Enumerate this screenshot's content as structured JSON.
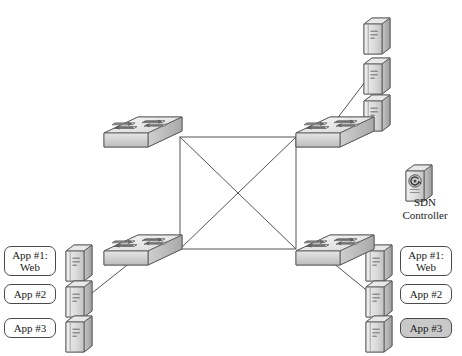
{
  "diagram": {
    "background_color": "#ffffff",
    "line_color": "#555555",
    "icon_fill_light": "#f2f2f2",
    "icon_fill_mid": "#d8d8d8",
    "icon_fill_dark": "#b8b8b8",
    "icon_stroke": "#5a5a5a"
  },
  "mesh": {
    "name": "full-mesh-core",
    "corners": {
      "x1": 180,
      "y1": 137,
      "x2": 296,
      "y2": 249
    },
    "diagonals": true
  },
  "switches": [
    {
      "id": "switch-top-left",
      "label": "",
      "x": 104,
      "y": 117
    },
    {
      "id": "switch-top-right",
      "label": "",
      "x": 296,
      "y": 117
    },
    {
      "id": "switch-bottom-left",
      "label": "",
      "x": 104,
      "y": 235
    },
    {
      "id": "switch-bottom-right",
      "label": "",
      "x": 296,
      "y": 235
    }
  ],
  "server_groups": [
    {
      "id": "servers-top-right",
      "servers": [
        {
          "id": "server-tr-1",
          "x": 364,
          "y": 18
        },
        {
          "id": "server-tr-2",
          "x": 364,
          "y": 58
        },
        {
          "id": "server-tr-3",
          "x": 364,
          "y": 95
        }
      ]
    },
    {
      "id": "servers-bottom-left",
      "servers": [
        {
          "id": "server-bl-1",
          "x": 66,
          "y": 245
        },
        {
          "id": "server-bl-2",
          "x": 66,
          "y": 281
        },
        {
          "id": "server-bl-3",
          "x": 66,
          "y": 316
        }
      ]
    },
    {
      "id": "servers-bottom-right",
      "servers": [
        {
          "id": "server-br-1",
          "x": 366,
          "y": 245
        },
        {
          "id": "server-br-2",
          "x": 366,
          "y": 281
        },
        {
          "id": "server-br-3",
          "x": 366,
          "y": 316
        }
      ]
    }
  ],
  "labels": {
    "left": [
      {
        "id": "label-left-app1",
        "text": "App #1:\nWeb",
        "x": 4,
        "y": 246,
        "w": 52,
        "h": 30,
        "shaded": false
      },
      {
        "id": "label-left-app2",
        "text": "App #2",
        "x": 4,
        "y": 284,
        "w": 52,
        "h": 20,
        "shaded": false
      },
      {
        "id": "label-left-app3",
        "text": "App #3",
        "x": 4,
        "y": 318,
        "w": 52,
        "h": 20,
        "shaded": false
      }
    ],
    "right": [
      {
        "id": "label-right-app1",
        "text": "App #1:\nWeb",
        "x": 400,
        "y": 246,
        "w": 52,
        "h": 30,
        "shaded": false
      },
      {
        "id": "label-right-app2",
        "text": "App #2",
        "x": 400,
        "y": 284,
        "w": 52,
        "h": 20,
        "shaded": false
      },
      {
        "id": "label-right-app3",
        "text": "App #3",
        "x": 400,
        "y": 318,
        "w": 52,
        "h": 20,
        "shaded": true
      }
    ]
  },
  "controller": {
    "id": "sdn-controller",
    "caption": "SDN\nController",
    "icon_x": 406,
    "icon_y": 165,
    "caption_x": 392,
    "caption_y": 196
  },
  "links": [
    {
      "id": "link-switch-tr-to-server",
      "from": "switch-top-right",
      "to": "server-tr-2",
      "x1": 330,
      "y1": 128,
      "x2": 368,
      "y2": 78
    },
    {
      "id": "link-switch-bl-to-server",
      "from": "switch-bottom-left",
      "to": "server-bl-2",
      "x1": 136,
      "y1": 258,
      "x2": 92,
      "y2": 293
    },
    {
      "id": "link-switch-br-to-server",
      "from": "switch-bottom-right",
      "to": "server-br-2",
      "x1": 327,
      "y1": 258,
      "x2": 370,
      "y2": 293
    }
  ]
}
